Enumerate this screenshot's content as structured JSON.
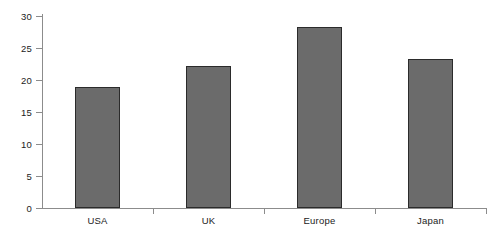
{
  "chart_data": {
    "type": "bar",
    "title": "",
    "subtitle": "",
    "xlabel": "",
    "ylabel": "",
    "categories": [
      "USA",
      "UK",
      "Europe",
      "Japan"
    ],
    "values": [
      18.9,
      22.2,
      28.3,
      23.3
    ],
    "ylim": [
      0,
      30
    ],
    "yticks": [
      0,
      5,
      10,
      15,
      20,
      25,
      30
    ],
    "ytick_labels": [
      "0",
      "5",
      "10",
      "15",
      "20",
      "25",
      "30"
    ],
    "grid": false,
    "legend": null,
    "legend_position": "none",
    "annotations": [],
    "colors": {
      "bar_fill": "#6b6b6b",
      "bar_border": "#2b2b2b",
      "axis": "#8c8c8c",
      "text": "#222222",
      "background": "#ffffff"
    }
  }
}
